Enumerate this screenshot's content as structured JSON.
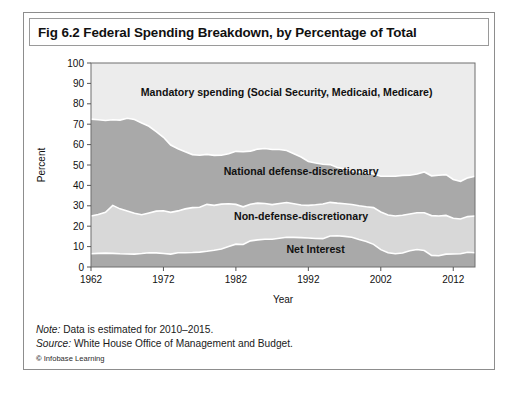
{
  "figure": {
    "title": "Fig 6.2 Federal Spending Breakdown, by Percentage of Total",
    "note_label": "Note:",
    "note_text": " Data is estimated for 2010–2015.",
    "source_label": "Source:",
    "source_text": " White House Office of Management and Budget.",
    "copyright_mark": "©",
    "copyright_text": " Infobase Learning"
  },
  "chart_data": {
    "type": "area",
    "title": "Fig 6.2 Federal Spending Breakdown, by Percentage of Total",
    "xlabel": "Year",
    "ylabel": "Percent",
    "xlim": [
      1962,
      2015
    ],
    "ylim": [
      0,
      100
    ],
    "xticks": [
      1962,
      1972,
      1982,
      1992,
      2002,
      2012
    ],
    "xticklabels": [
      "1962",
      "1972",
      "1982",
      "1992",
      "2002",
      "2012"
    ],
    "yticks": [
      0,
      10,
      20,
      30,
      40,
      50,
      60,
      70,
      80,
      90,
      100
    ],
    "yticklabels": [
      "0",
      "10",
      "20",
      "30",
      "40",
      "50",
      "60",
      "70",
      "80",
      "90",
      "100"
    ],
    "grid": false,
    "legend": "inline-band-labels",
    "stacked": true,
    "stack_order_bottom_to_top": [
      "Net Interest",
      "Non-defense-discretionary",
      "National defense-discretionary",
      "Mandatory spending (Social Security, Medicaid, Medicare)"
    ],
    "colors": {
      "net_interest": "#a9a9a9",
      "non_defense_discretionary": "#d8d8d8",
      "national_defense_discretionary": "#a9a9a9",
      "mandatory_spending": "#ececec",
      "separator": "#ffffff",
      "plot_background": "#ececec",
      "frame": "#6e6e6e"
    },
    "x": [
      1962,
      1963,
      1964,
      1965,
      1966,
      1967,
      1968,
      1969,
      1970,
      1971,
      1972,
      1973,
      1974,
      1975,
      1976,
      1977,
      1978,
      1979,
      1980,
      1981,
      1982,
      1983,
      1984,
      1985,
      1986,
      1987,
      1988,
      1989,
      1990,
      1991,
      1992,
      1993,
      1994,
      1995,
      1996,
      1997,
      1998,
      1999,
      2000,
      2001,
      2002,
      2003,
      2004,
      2005,
      2006,
      2007,
      2008,
      2009,
      2010,
      2011,
      2012,
      2013,
      2014,
      2015
    ],
    "series": [
      {
        "name": "Net Interest",
        "values": [
          6.5,
          6.7,
          6.8,
          6.7,
          6.5,
          6.4,
          6.3,
          6.6,
          7.0,
          6.9,
          6.6,
          6.3,
          7.0,
          7.0,
          7.1,
          7.3,
          7.7,
          8.2,
          8.8,
          10.0,
          11.2,
          11.0,
          12.8,
          13.3,
          13.6,
          13.6,
          14.1,
          14.6,
          14.5,
          14.4,
          14.2,
          14.0,
          13.9,
          15.2,
          15.3,
          15.0,
          14.6,
          13.5,
          12.5,
          11.1,
          8.5,
          7.0,
          6.5,
          6.9,
          8.0,
          8.6,
          8.1,
          5.7,
          5.5,
          6.3,
          6.4,
          6.5,
          7.2,
          7.0
        ]
      },
      {
        "name": "Non-defense-discretionary",
        "values": [
          18.5,
          19.0,
          20.0,
          23.5,
          22.0,
          21.0,
          20.0,
          19.0,
          19.5,
          20.5,
          21.0,
          20.5,
          20.5,
          21.5,
          22.0,
          22.0,
          23.0,
          22.0,
          22.0,
          21.0,
          19.5,
          18.5,
          18.0,
          18.0,
          17.5,
          17.0,
          17.0,
          17.0,
          16.5,
          16.0,
          16.0,
          16.5,
          17.0,
          16.5,
          16.0,
          16.0,
          16.0,
          16.5,
          17.0,
          18.0,
          18.5,
          18.5,
          18.5,
          18.5,
          18.0,
          18.0,
          18.5,
          19.5,
          19.5,
          19.0,
          17.5,
          17.0,
          17.5,
          18.0
        ]
      },
      {
        "name": "National defense-discretionary",
        "values": [
          47.5,
          46.5,
          45.0,
          42.0,
          43.5,
          45.5,
          46.0,
          45.0,
          42.5,
          39.0,
          36.0,
          33.0,
          30.5,
          28.0,
          26.0,
          25.5,
          24.5,
          24.5,
          24.0,
          24.5,
          26.0,
          27.0,
          26.0,
          26.5,
          27.0,
          27.0,
          26.5,
          25.5,
          24.5,
          23.5,
          21.5,
          20.5,
          19.5,
          18.5,
          17.5,
          17.0,
          16.5,
          16.5,
          16.5,
          16.5,
          17.5,
          19.0,
          19.5,
          19.5,
          19.0,
          19.0,
          20.0,
          19.5,
          20.0,
          20.0,
          19.0,
          18.5,
          19.0,
          19.5
        ]
      },
      {
        "name": "Mandatory spending (Social Security, Medicaid, Medicare)",
        "values": [
          27.5,
          27.8,
          28.2,
          27.8,
          28.0,
          27.1,
          27.7,
          29.4,
          31.0,
          33.6,
          36.4,
          40.2,
          42.0,
          43.5,
          44.9,
          45.2,
          44.8,
          45.3,
          45.2,
          44.5,
          43.3,
          43.5,
          43.2,
          42.2,
          41.9,
          42.4,
          42.4,
          42.9,
          44.5,
          46.1,
          48.3,
          49.0,
          49.6,
          49.8,
          51.2,
          52.0,
          52.9,
          53.5,
          54.0,
          54.4,
          55.5,
          55.5,
          55.5,
          55.1,
          55.0,
          54.4,
          53.4,
          55.3,
          55.0,
          54.7,
          57.1,
          58.0,
          56.3,
          55.5
        ]
      }
    ],
    "band_labels": [
      {
        "text": "Mandatory spending (Social Security, Medicaid, Medicare)",
        "x": 1989,
        "y": 84
      },
      {
        "text": "National defense-discretionary",
        "x": 1991,
        "y": 45
      },
      {
        "text": "Non-defense-discretionary",
        "x": 1991,
        "y": 23
      },
      {
        "text": "Net Interest",
        "x": 1993,
        "y": 7
      }
    ]
  }
}
